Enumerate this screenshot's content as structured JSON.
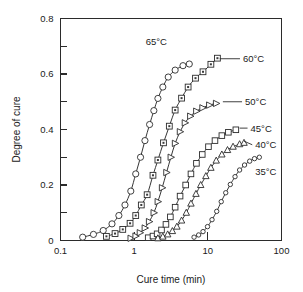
{
  "chart_data": {
    "type": "line",
    "title": "",
    "subtitle": "",
    "xlabel": "Cure time (min)",
    "ylabel": "Degree of cure",
    "xscale": "log",
    "yscale": "linear",
    "xlim": [
      0.1,
      100
    ],
    "ylim": [
      0,
      0.8
    ],
    "grid": false,
    "legend_position": "inline-annotations",
    "xticks": [
      "0.1",
      "1",
      "10",
      "100"
    ],
    "xtick_values": [
      0.1,
      1,
      10,
      100
    ],
    "yticks": [
      "0",
      "0.2",
      "0.4",
      "0.6",
      "0.8"
    ],
    "ytick_values": [
      0,
      0.2,
      0.4,
      0.6,
      0.8
    ],
    "ytick_minor_values": [
      0.1,
      0.3,
      0.5,
      0.7
    ],
    "series": [
      {
        "name": "65°C",
        "marker": "open-circle",
        "label_x": 2.0,
        "label_y": 0.715,
        "leader": false,
        "x": [
          0.2,
          0.28,
          0.38,
          0.5,
          0.62,
          0.75,
          0.9,
          1.05,
          1.22,
          1.4,
          1.62,
          1.85,
          2.1,
          2.45,
          2.9,
          3.6,
          4.6,
          5.6
        ],
        "y": [
          0.012,
          0.022,
          0.036,
          0.06,
          0.09,
          0.128,
          0.178,
          0.24,
          0.3,
          0.36,
          0.418,
          0.468,
          0.512,
          0.553,
          0.589,
          0.614,
          0.63,
          0.636
        ]
      },
      {
        "name": "60°C",
        "marker": "square-dot",
        "label_x": 30.0,
        "label_y": 0.655,
        "leader": true,
        "leader_x0": 14.5,
        "leader_y0": 0.655,
        "x": [
          0.42,
          0.55,
          0.7,
          0.88,
          1.05,
          1.25,
          1.5,
          1.8,
          2.1,
          2.5,
          3.0,
          3.6,
          4.4,
          5.4,
          6.8,
          8.6,
          11.0,
          13.5
        ],
        "y": [
          0.015,
          0.025,
          0.04,
          0.062,
          0.09,
          0.128,
          0.165,
          0.235,
          0.29,
          0.352,
          0.412,
          0.47,
          0.513,
          0.553,
          0.585,
          0.608,
          0.635,
          0.657
        ]
      },
      {
        "name": "50°C",
        "marker": "right-triangle",
        "label_x": 32.0,
        "label_y": 0.5,
        "leader": true,
        "leader_x0": 16.0,
        "leader_y0": 0.5,
        "x": [
          0.9,
          1.05,
          1.2,
          1.4,
          1.6,
          1.85,
          2.1,
          2.4,
          2.75,
          3.15,
          3.6,
          4.2,
          4.9,
          5.8,
          7.0,
          8.5,
          10.5,
          13.0
        ],
        "y": [
          0.008,
          0.016,
          0.028,
          0.045,
          0.068,
          0.1,
          0.14,
          0.19,
          0.245,
          0.3,
          0.35,
          0.392,
          0.424,
          0.448,
          0.466,
          0.478,
          0.488,
          0.494
        ]
      },
      {
        "name": "45°C",
        "marker": "open-square",
        "label_x": 38.0,
        "label_y": 0.405,
        "leader": true,
        "leader_x0": 27.0,
        "leader_y0": 0.405,
        "x": [
          1.55,
          1.8,
          2.05,
          2.35,
          2.7,
          3.1,
          3.6,
          4.2,
          5.0,
          5.9,
          7.0,
          8.4,
          10.2,
          12.5,
          15.5,
          19.0,
          24.0
        ],
        "y": [
          0.01,
          0.016,
          0.024,
          0.038,
          0.058,
          0.085,
          0.12,
          0.16,
          0.2,
          0.24,
          0.278,
          0.31,
          0.338,
          0.36,
          0.378,
          0.39,
          0.399
        ]
      },
      {
        "name": "40°C",
        "marker": "up-triangle",
        "label_x": 44.0,
        "label_y": 0.345,
        "leader": true,
        "leader_x0": 31.0,
        "leader_y0": 0.358,
        "x": [
          2.1,
          2.45,
          2.85,
          3.3,
          3.8,
          4.4,
          5.1,
          5.9,
          6.9,
          8.0,
          9.4,
          11.0,
          13.0,
          15.5,
          18.5,
          22.0,
          27.0,
          31.0
        ],
        "y": [
          0.008,
          0.014,
          0.022,
          0.034,
          0.05,
          0.072,
          0.1,
          0.133,
          0.168,
          0.2,
          0.232,
          0.262,
          0.288,
          0.31,
          0.326,
          0.338,
          0.347,
          0.352
        ]
      },
      {
        "name": "35°C",
        "marker": "small-circle",
        "label_x": 44.0,
        "label_y": 0.25,
        "leader": false,
        "x": [
          6.5,
          7.5,
          8.6,
          9.9,
          11.4,
          13.2,
          15.2,
          17.5,
          20.2,
          23.4,
          27.0,
          31.5,
          37.0,
          43.0,
          50.0
        ],
        "y": [
          0.012,
          0.02,
          0.032,
          0.05,
          0.075,
          0.105,
          0.14,
          0.172,
          0.202,
          0.23,
          0.254,
          0.272,
          0.286,
          0.295,
          0.3
        ]
      }
    ]
  }
}
